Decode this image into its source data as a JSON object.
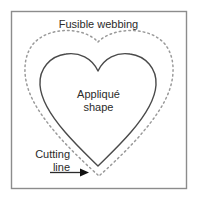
{
  "figure": {
    "background_color": "#ffffff",
    "border_color": "#8c8c8c",
    "shape_line_color": "#4a4a4a",
    "cut_line_color": "#9a9a9a",
    "text_color": "#2b2b2b",
    "labels": {
      "fusible_webbing": "Fusible webbing",
      "applique_shape": "Appliqué\nshape",
      "cutting_line": "Cutting\nline"
    },
    "elements": {
      "webbing_square": "fusible-webbing-square",
      "applique_heart": "applique-heart-outline",
      "cutting_line": "dotted-cutting-line",
      "pointer": "cutting-line-arrow"
    }
  }
}
